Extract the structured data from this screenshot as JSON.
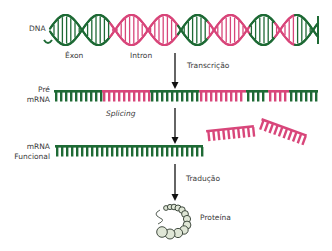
{
  "colors": {
    "exon": "#1e6a35",
    "intron": "#d8467a",
    "arrow": "#111111",
    "text": "#3a3a3a",
    "protein_fill": "#dfe6d6",
    "protein_stroke": "#2f3a2f"
  },
  "labels": {
    "dna": "DNA",
    "exon": "Éxon",
    "intron": "Intron",
    "transcription": "Transcrição",
    "pre_mrna_line1": "Pré",
    "pre_mrna_line2": "mRNA",
    "splicing": "Splicing",
    "functional_mrna_line1": "mRNA",
    "functional_mrna_line2": "Funcional",
    "translation": "Tradução",
    "protein": "Proteína"
  },
  "dna_segments": [
    {
      "type": "exon",
      "x0": 50,
      "x1": 110
    },
    {
      "type": "intron",
      "x0": 110,
      "x1": 178
    },
    {
      "type": "exon",
      "x0": 178,
      "x1": 208
    },
    {
      "type": "intron",
      "x0": 208,
      "x1": 250
    },
    {
      "type": "exon",
      "x0": 250,
      "x1": 275
    },
    {
      "type": "intron",
      "x0": 275,
      "x1": 295
    },
    {
      "type": "exon",
      "x0": 295,
      "x1": 318
    }
  ],
  "pre_mrna_segments": [
    {
      "type": "exon",
      "x0": 54,
      "x1": 102
    },
    {
      "type": "intron",
      "x0": 102,
      "x1": 150
    },
    {
      "type": "exon",
      "x0": 150,
      "x1": 199
    },
    {
      "type": "intron",
      "x0": 199,
      "x1": 246
    },
    {
      "type": "exon",
      "x0": 246,
      "x1": 268
    },
    {
      "type": "intron",
      "x0": 268,
      "x1": 289
    },
    {
      "type": "exon",
      "x0": 289,
      "x1": 318
    }
  ],
  "functional_mrna": {
    "x0": 55,
    "x1": 203
  },
  "steps": [
    "Transcrição",
    "Splicing",
    "Tradução"
  ]
}
